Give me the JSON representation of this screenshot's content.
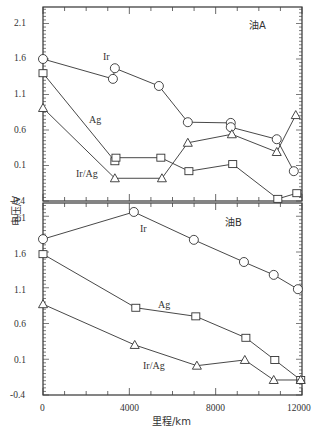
{
  "chart_data": [
    {
      "type": "line",
      "panel_title": "油A",
      "xlabel": "里程/km",
      "ylabel": "电压/V",
      "xlim": [
        0,
        12000
      ],
      "ylim": [
        -0.4,
        2.4
      ],
      "yticks": [
        -0.4,
        0.1,
        0.6,
        1.1,
        1.6,
        2.1
      ],
      "xticks": [
        0,
        4000,
        8000,
        12000
      ],
      "grid": false,
      "legend": "inline labels",
      "series": [
        {
          "name": "Ir",
          "marker": "circle",
          "x": [
            0,
            3240,
            3330,
            5370,
            6710,
            8700,
            8700,
            10830,
            11620
          ],
          "y": [
            1.6,
            1.32,
            1.47,
            1.22,
            0.71,
            0.7,
            0.64,
            0.47,
            0.02
          ]
        },
        {
          "name": "Ag",
          "marker": "square",
          "x": [
            0,
            3330,
            3380,
            5460,
            6760,
            8790,
            10880,
            11760
          ],
          "y": [
            1.4,
            0.16,
            0.21,
            0.21,
            0.02,
            0.12,
            -0.37,
            -0.29
          ]
        },
        {
          "name": "Ir/Ag",
          "marker": "triangle",
          "x": [
            0,
            3330,
            5510,
            6710,
            8750,
            10830,
            11710
          ],
          "y": [
            0.91,
            -0.08,
            -0.08,
            0.42,
            0.54,
            0.29,
            0.81
          ]
        }
      ]
    },
    {
      "type": "line",
      "panel_title": "油B",
      "xlabel": "里程/km",
      "ylabel": "电压/V",
      "xlim": [
        0,
        12000
      ],
      "ylim": [
        -0.4,
        2.3
      ],
      "yticks": [
        -0.4,
        0.1,
        0.6,
        1.1,
        1.6,
        2.1
      ],
      "xticks": [
        0,
        4000,
        8000,
        12000
      ],
      "grid": false,
      "legend": "inline labels",
      "series": [
        {
          "name": "Ir",
          "marker": "circle",
          "x": [
            0,
            4210,
            6990,
            9310,
            10690,
            11810
          ],
          "y": [
            1.78,
            2.16,
            1.77,
            1.46,
            1.28,
            1.08
          ]
        },
        {
          "name": "Ag",
          "marker": "square",
          "x": [
            0,
            4300,
            7080,
            9400,
            10740,
            11940
          ],
          "y": [
            1.57,
            0.82,
            0.7,
            0.4,
            0.09,
            -0.19
          ]
        },
        {
          "name": "Ir/Ag",
          "marker": "triangle",
          "x": [
            0,
            4250,
            7130,
            9350,
            10690,
            11940
          ],
          "y": [
            0.87,
            0.3,
            0.01,
            0.09,
            -0.19,
            -0.19
          ]
        }
      ]
    }
  ],
  "labels": {
    "panel_a": "油A",
    "panel_b": "油B",
    "ylabel": "电压/V",
    "xlabel": "里程/km",
    "a_ir": "Ir",
    "a_ag": "Ag",
    "a_irag": "Ir/Ag",
    "b_ir": "Ir",
    "b_ag": "Ag",
    "b_irag": "Ir/Ag",
    "ytick": [
      "2.1",
      "1.6",
      "1.1",
      "0.6",
      "0.1",
      "-0.4"
    ],
    "xtick": [
      "0",
      "4000",
      "8000",
      "12000"
    ]
  }
}
